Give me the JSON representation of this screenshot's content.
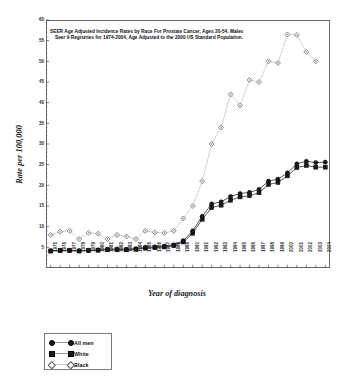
{
  "chart_data": {
    "type": "line",
    "title": "SEER  Age Adjusted Incidence Rates by Race For Prostate Cancer,  Ages 20-54, Males",
    "title_line2": "Seer 9 Registries for 1974-2004, Age Adjusted to the 2000 US Standard Population.",
    "xlabel": "Year of diagnosis",
    "ylabel": "Rate per 100,000",
    "ylim": [
      0,
      60
    ],
    "ytick_labels": [
      "5",
      "10",
      "15",
      "20",
      "25",
      "30",
      "35",
      "40",
      "45",
      "50",
      "55",
      "60"
    ],
    "ytick_values": [
      5,
      10,
      15,
      20,
      25,
      30,
      35,
      40,
      45,
      50,
      55,
      60
    ],
    "grid": false,
    "legend_position": "below-left",
    "categories": [
      "1975",
      "1976",
      "1977",
      "1978",
      "1979",
      "1980",
      "1981",
      "1982",
      "1983",
      "1984",
      "1985",
      "1986",
      "1987",
      "1988",
      "1989",
      "1990",
      "1991",
      "1992",
      "1993",
      "1994",
      "1995",
      "1996",
      "1997",
      "1998",
      "1999",
      "2000",
      "2001",
      "2002",
      "2003",
      "2004"
    ],
    "series": [
      {
        "name": "All men",
        "marker": "circle",
        "color": "#1b1b1b",
        "values": [
          4.2,
          4.3,
          4.3,
          4.2,
          4.3,
          4.4,
          4.5,
          4.6,
          4.5,
          4.7,
          5.0,
          5.1,
          5.3,
          5.6,
          6.6,
          9.0,
          12.5,
          15.5,
          16.0,
          17.3,
          18.0,
          18.3,
          19.0,
          21.0,
          21.5,
          23.0,
          25.2,
          25.8,
          25.5,
          25.6
        ]
      },
      {
        "name": "White",
        "marker": "square",
        "color": "#1b1b1b",
        "values": [
          4.1,
          4.2,
          4.2,
          4.1,
          4.2,
          4.3,
          4.4,
          4.4,
          4.4,
          4.5,
          4.8,
          4.9,
          5.1,
          5.4,
          6.3,
          8.4,
          11.8,
          14.6,
          15.2,
          16.4,
          17.2,
          17.5,
          18.2,
          20.2,
          20.7,
          22.3,
          24.3,
          24.8,
          24.4,
          24.4
        ]
      },
      {
        "name": "Black",
        "marker": "diamond",
        "color": "#6f6f6f",
        "values": [
          8.0,
          8.8,
          9.0,
          7.0,
          8.5,
          8.3,
          7.0,
          8.0,
          7.6,
          7.0,
          9.0,
          8.6,
          8.5,
          9.0,
          12.0,
          15.0,
          21.0,
          30.0,
          34.0,
          42.0,
          39.3,
          45.5,
          45.0,
          50.0,
          49.6,
          56.5,
          56.4,
          52.3,
          50.0,
          null
        ]
      }
    ]
  },
  "legend": {
    "items": [
      {
        "label": "All men",
        "marker": "circle"
      },
      {
        "label": "White",
        "marker": "square"
      },
      {
        "label": "Black",
        "marker": "diamond"
      }
    ]
  }
}
